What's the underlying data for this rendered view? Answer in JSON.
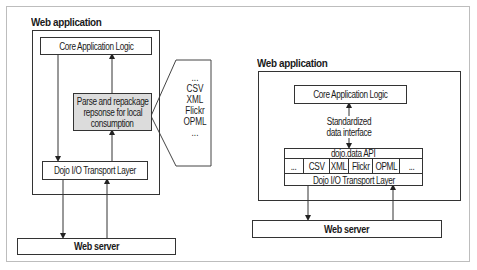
{
  "left": {
    "title": "Web application",
    "core": "Core Application Logic",
    "parse": [
      "Parse and repackage",
      "repsonse for local",
      "consumption"
    ],
    "transport": "Dojo I/O Transport Layer",
    "server": "Web server",
    "formats": [
      "...",
      "CSV",
      "XML",
      "Flickr",
      "OPML",
      "..."
    ],
    "parse_fill": "#dcdcdc"
  },
  "right": {
    "title": "Web application",
    "core": "Core Application Logic",
    "interface_label": [
      "Standardized",
      "data interface"
    ],
    "api": "dojo.data API",
    "formats": [
      "...",
      "CSV",
      "XML",
      "Flickr",
      "OPML",
      "..."
    ],
    "transport": "Dojo I/O Transport Layer",
    "server": "Web server"
  }
}
